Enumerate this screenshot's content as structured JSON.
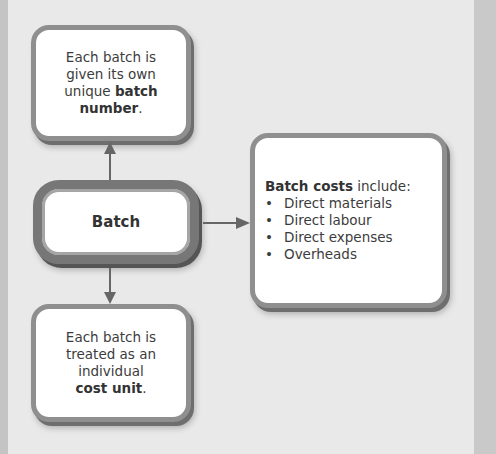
{
  "diagram": {
    "top_box": {
      "lines": [
        "Each batch is",
        "given its own",
        "unique "
      ],
      "bold_1": "batch",
      "bold_2": "number",
      "suffix": "."
    },
    "center_box": {
      "label": "Batch"
    },
    "bottom_box": {
      "lines": [
        "Each batch is",
        "treated as an",
        "individual"
      ],
      "bold": "cost unit",
      "suffix": "."
    },
    "right_box": {
      "heading_bold": "Batch costs",
      "heading_rest": " include:",
      "bullet_symbol": "•",
      "items": [
        "Direct materials",
        "Direct labour",
        "Direct expenses",
        "Overheads"
      ]
    },
    "colors": {
      "background": "#e9e9e9",
      "box_border": "#8f8f8f",
      "arrow": "#666666",
      "text": "#3c3c3c"
    }
  }
}
